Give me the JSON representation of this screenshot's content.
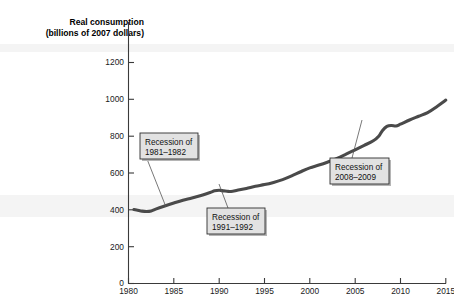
{
  "figure": {
    "y_axis_title_line1": "Real consumption",
    "y_axis_title_line2": "(billions of 2007 dollars)"
  },
  "chart_data": {
    "type": "line",
    "title": "",
    "subtitle": "",
    "xlabel": "",
    "ylabel": "Real consumption (billions of 2007 dollars)",
    "xlim": [
      1980,
      2015
    ],
    "ylim": [
      0,
      1300
    ],
    "xticks": [
      1980,
      1985,
      1990,
      1995,
      2000,
      2005,
      2010,
      2015
    ],
    "xticklabels": [
      "1980",
      "1985",
      "1990",
      "1995",
      "2000",
      "2005",
      "2010",
      "2015"
    ],
    "yticks": [
      0,
      200,
      400,
      600,
      800,
      1000,
      1200
    ],
    "yticklabels": [
      "0",
      "200",
      "400",
      "600",
      "800",
      "1000",
      "1200"
    ],
    "grid": false,
    "legend": null,
    "series": [
      {
        "name": "Real consumption",
        "color": "#4a4a4a",
        "x": [
          1980.6,
          1981,
          1981.5,
          1982,
          1982.5,
          1983,
          1984,
          1985,
          1986,
          1987,
          1988,
          1989,
          1989.5,
          1990,
          1990.5,
          1991,
          1991.5,
          1992,
          1993,
          1994,
          1995,
          1996,
          1997,
          1998,
          1999,
          2000,
          2001,
          2002,
          2003,
          2004,
          2005,
          2006,
          2007,
          2007.6,
          2008,
          2008.5,
          2009,
          2009.5,
          2010,
          2011,
          2012,
          2013,
          2014,
          2015
        ],
        "y": [
          402,
          398,
          393,
          391,
          394,
          404,
          421,
          437,
          452,
          464,
          478,
          494,
          503,
          506,
          503,
          500,
          501,
          506,
          516,
          528,
          537,
          549,
          564,
          584,
          607,
          628,
          643,
          660,
          679,
          702,
          726,
          750,
          775,
          800,
          830,
          853,
          858,
          855,
          865,
          888,
          908,
          928,
          960,
          996
        ]
      }
    ],
    "annotations": [
      {
        "id": "recession-1981-1982",
        "line1": "Recession of",
        "line2": "1981–1982",
        "box": {
          "x": 140,
          "y": 133,
          "w": 58,
          "h": 26
        },
        "leader": {
          "x1": 147,
          "y1": 159,
          "x2": 166,
          "y2": 207
        }
      },
      {
        "id": "recession-1991-1992",
        "line1": "Recession of",
        "line2": "1991–1992",
        "box": {
          "x": 207,
          "y": 208,
          "w": 58,
          "h": 26
        },
        "leader": {
          "x1": 228,
          "y1": 208,
          "x2": 219,
          "y2": 184
        }
      },
      {
        "id": "recession-2008-2009",
        "line1": "Recession of",
        "line2": "2008–2009",
        "box": {
          "x": 330,
          "y": 158,
          "w": 59,
          "h": 26
        },
        "leader": {
          "x1": 352,
          "y1": 158,
          "x2": 362,
          "y2": 120
        }
      }
    ]
  }
}
